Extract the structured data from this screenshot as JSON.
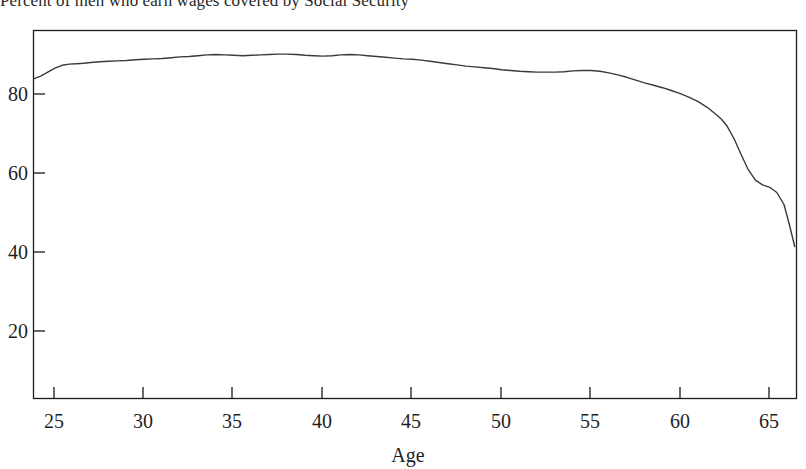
{
  "figure": {
    "title": "Percent of men who earn wages covered by Social Security",
    "background_color": "#ffffff",
    "line_color": "#3a3a3a",
    "axis_color": "#1a1a1a"
  },
  "chart_data": {
    "type": "line",
    "title": "Percent of men who earn wages covered by Social Security",
    "xlabel": "Age",
    "ylabel": "",
    "xlim": [
      23.8,
      66.5
    ],
    "ylim": [
      0,
      92
    ],
    "grid": false,
    "legend": null,
    "xticks": [
      25,
      30,
      35,
      40,
      45,
      50,
      55,
      60,
      65
    ],
    "yticks": [
      20,
      40,
      60,
      80
    ],
    "xtick_labels": [
      "25",
      "30",
      "35",
      "40",
      "45",
      "50",
      "55",
      "60",
      "65"
    ],
    "ytick_labels": [
      "20",
      "40",
      "60",
      "80"
    ],
    "series": [
      {
        "name": "Percent covered",
        "x": [
          23.8,
          24.2,
          24.6,
          25.0,
          25.4,
          25.8,
          26.2,
          26.6,
          27.0,
          27.5,
          28.0,
          28.5,
          29.0,
          29.5,
          30.0,
          30.5,
          31.0,
          31.5,
          32.0,
          32.5,
          33.0,
          33.5,
          34.0,
          34.5,
          35.0,
          35.5,
          36.0,
          36.5,
          37.0,
          37.5,
          38.0,
          38.5,
          39.0,
          39.5,
          40.0,
          40.5,
          41.0,
          41.5,
          42.0,
          42.5,
          43.0,
          43.5,
          44.0,
          44.5,
          45.0,
          45.5,
          46.0,
          46.5,
          47.0,
          47.5,
          48.0,
          48.5,
          49.0,
          49.5,
          50.0,
          50.5,
          51.0,
          51.5,
          52.0,
          52.5,
          53.0,
          53.5,
          54.0,
          54.5,
          55.0,
          55.5,
          56.0,
          56.5,
          57.0,
          57.5,
          58.0,
          58.5,
          59.0,
          59.5,
          60.0,
          60.5,
          61.0,
          61.5,
          62.0,
          62.3,
          62.6,
          63.0,
          63.4,
          63.8,
          64.2,
          64.6,
          65.0,
          65.4,
          65.8,
          66.1,
          66.4
        ],
        "y": [
          79.9,
          80.6,
          81.6,
          82.6,
          83.3,
          83.6,
          83.7,
          83.8,
          84.0,
          84.2,
          84.3,
          84.4,
          84.5,
          84.7,
          84.8,
          84.9,
          85.0,
          85.2,
          85.4,
          85.5,
          85.7,
          85.9,
          86.0,
          85.9,
          85.8,
          85.7,
          85.8,
          85.9,
          86.0,
          86.1,
          86.1,
          86.0,
          85.8,
          85.7,
          85.6,
          85.7,
          85.9,
          86.0,
          85.9,
          85.7,
          85.5,
          85.3,
          85.1,
          84.9,
          84.8,
          84.6,
          84.3,
          84.0,
          83.7,
          83.4,
          83.1,
          82.9,
          82.7,
          82.5,
          82.2,
          82.0,
          81.8,
          81.7,
          81.6,
          81.6,
          81.6,
          81.7,
          81.9,
          82.0,
          82.0,
          81.8,
          81.4,
          80.9,
          80.3,
          79.6,
          78.9,
          78.3,
          77.7,
          77.0,
          76.2,
          75.3,
          74.2,
          72.8,
          71.0,
          69.8,
          68.2,
          65.0,
          61.0,
          57.2,
          54.6,
          53.4,
          52.8,
          51.5,
          48.5,
          43.5,
          38.0
        ],
        "color": "#3a3a3a",
        "style": "solid",
        "width": 1.4
      }
    ],
    "annotations": []
  },
  "axes": {
    "x_axis_label": "Age",
    "y_axis_label": ""
  }
}
